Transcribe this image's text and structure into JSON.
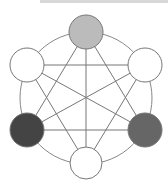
{
  "diagram": {
    "type": "graph",
    "outer_circle": {
      "cx": 86,
      "cy": 98,
      "r": 66,
      "stroke": "#888888"
    },
    "edge_color": "#777777",
    "node_stroke": "#777777",
    "nodes": [
      {
        "id": "top",
        "cx": 86,
        "cy": 32,
        "r": 17,
        "fill": "#bbbbbb"
      },
      {
        "id": "upper-right",
        "cx": 145,
        "cy": 65,
        "r": 17,
        "fill": "#ffffff"
      },
      {
        "id": "lower-right",
        "cx": 145,
        "cy": 130,
        "r": 17,
        "fill": "#666666"
      },
      {
        "id": "bottom",
        "cx": 86,
        "cy": 163,
        "r": 16,
        "fill": "#ffffff"
      },
      {
        "id": "lower-left",
        "cx": 27,
        "cy": 130,
        "r": 17,
        "fill": "#444444"
      },
      {
        "id": "upper-left",
        "cx": 27,
        "cy": 65,
        "r": 17,
        "fill": "#ffffff"
      }
    ],
    "chords": [
      [
        "top",
        "lower-left"
      ],
      [
        "top",
        "bottom"
      ],
      [
        "top",
        "lower-right"
      ],
      [
        "upper-left",
        "upper-right"
      ],
      [
        "upper-left",
        "lower-right"
      ],
      [
        "upper-left",
        "bottom"
      ],
      [
        "upper-right",
        "lower-left"
      ],
      [
        "upper-right",
        "bottom"
      ],
      [
        "lower-left",
        "lower-right"
      ]
    ]
  }
}
